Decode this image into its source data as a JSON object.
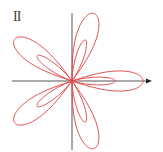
{
  "figure": {
    "label": "II",
    "curve_color": "#e05050",
    "axis_color": "#555555",
    "center": [
      72,
      81
    ],
    "petals": 5,
    "outer_radius": 71,
    "inner_radius": 43,
    "x_axis": {
      "from": 12,
      "to": 152,
      "arrow": true
    },
    "y_axis": {
      "from": 13,
      "to": 150,
      "arrow": false
    }
  }
}
